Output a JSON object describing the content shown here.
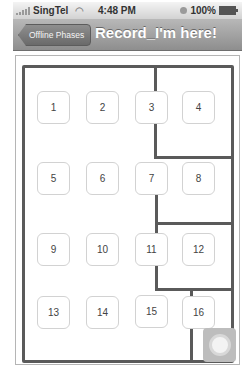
{
  "status_bar": {
    "carrier": "SingTel",
    "time": "4:48 PM",
    "battery": "100%",
    "icons": [
      "signal-icon",
      "wifi-icon",
      "lock-rotation-icon",
      "battery-icon"
    ]
  },
  "nav_bar": {
    "back_label": "Offline Phases",
    "title": "Record_I'm here!"
  },
  "map": {
    "rooms": [
      {
        "label": "1"
      },
      {
        "label": "2"
      },
      {
        "label": "3"
      },
      {
        "label": "4"
      },
      {
        "label": "5"
      },
      {
        "label": "6"
      },
      {
        "label": "7"
      },
      {
        "label": "8"
      },
      {
        "label": "9"
      },
      {
        "label": "10"
      },
      {
        "label": "11"
      },
      {
        "label": "12"
      },
      {
        "label": "13"
      },
      {
        "label": "14"
      },
      {
        "label": "15"
      },
      {
        "label": "16"
      }
    ],
    "wall_color": "#5a5a5a"
  },
  "assistive_touch": {
    "icon": "assistive-touch-icon"
  }
}
